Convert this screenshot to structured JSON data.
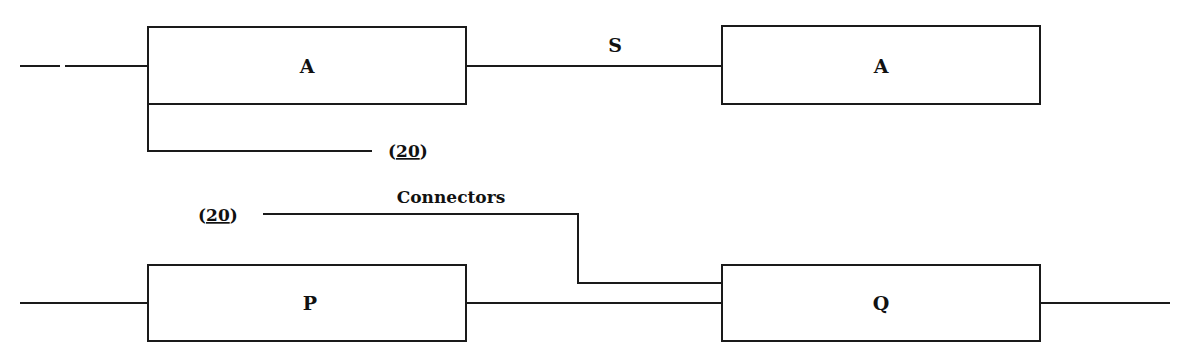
{
  "diagram": {
    "blocks": [
      {
        "id": "a1",
        "label": "A"
      },
      {
        "id": "a2",
        "label": "A"
      },
      {
        "id": "p",
        "label": "P"
      },
      {
        "id": "q",
        "label": "Q"
      }
    ],
    "connections": [
      {
        "from": "input-top",
        "to": "a1"
      },
      {
        "from": "a1",
        "to": "a2",
        "label": "S"
      },
      {
        "from": "a1",
        "to": "ref-20-top",
        "label": "(20)"
      },
      {
        "from": "ref-20-bottom",
        "to": "q",
        "label": "Connectors"
      },
      {
        "from": "input-bottom",
        "to": "p"
      },
      {
        "from": "p",
        "to": "q"
      },
      {
        "from": "q",
        "to": "output"
      }
    ],
    "labels": {
      "s": "S",
      "connectors": "Connectors",
      "ref_top_open": "(",
      "ref_top_num": "20",
      "ref_top_close": ")",
      "ref_bottom_open": "(",
      "ref_bottom_num": "20",
      "ref_bottom_close": ")"
    }
  }
}
